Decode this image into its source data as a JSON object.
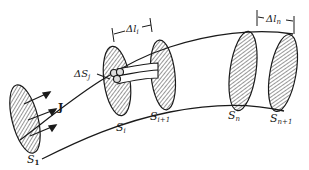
{
  "diagram": {
    "labels": {
      "J": "J",
      "S1": "S",
      "S1_sub": "1",
      "Si": "S",
      "Si_sub": "i",
      "Si1": "S",
      "Si1_sub": "i+1",
      "Sn": "S",
      "Sn_sub": "n",
      "Sn1": "S",
      "Sn1_sub": "n+1",
      "dSj": "ΔS",
      "dSj_sub": "j",
      "dli": "Δl",
      "dli_sub": "i",
      "dln": "Δl",
      "dln_sub": "n"
    },
    "colors": {
      "ink": "#1a1a1a",
      "background": "#ffffff"
    }
  }
}
